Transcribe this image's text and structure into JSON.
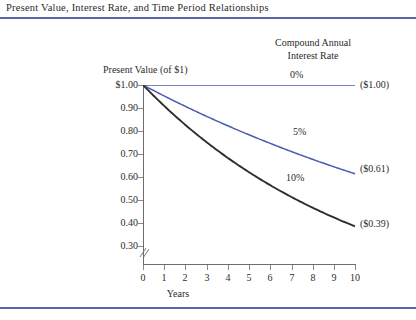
{
  "figure": {
    "title": "Present Value, Interest Rate, and Time Period Relationships",
    "rule_color": "#5b66a8"
  },
  "legend": {
    "header_line1": "Compound Annual",
    "header_line2": "Interest Rate"
  },
  "axes": {
    "y_title": "Present Value (of $1)",
    "x_title": "Years",
    "y_tick_labels": [
      "$1.00",
      "0.90",
      "0.80",
      "0.70",
      "0.60",
      "0.50",
      "0.40",
      "0.30"
    ],
    "x_tick_labels": [
      "0",
      "1",
      "2",
      "3",
      "4",
      "5",
      "6",
      "7",
      "8",
      "9",
      "10"
    ]
  },
  "curve_labels": {
    "rate0": "0%",
    "rate5": "5%",
    "rate10": "10%"
  },
  "end_labels": {
    "rate0": "($1.00)",
    "rate5": "($0.61)",
    "rate10": "($0.39)"
  },
  "chart_data": {
    "type": "line",
    "title": "Present Value, Interest Rate, and Time Period Relationships",
    "xlabel": "Years",
    "ylabel": "Present Value (of $1)",
    "xlim": [
      0,
      10
    ],
    "ylim": [
      0.25,
      1.0
    ],
    "ytick_values": [
      1.0,
      0.9,
      0.8,
      0.7,
      0.6,
      0.5,
      0.4,
      0.3
    ],
    "ytick_labels": [
      "$1.00",
      "0.90",
      "0.80",
      "0.70",
      "0.60",
      "0.50",
      "0.40",
      "0.30"
    ],
    "xtick_values": [
      0,
      1,
      2,
      3,
      4,
      5,
      6,
      7,
      8,
      9,
      10
    ],
    "y_axis_broken_below": 0.3,
    "grid": false,
    "legend_position": "inline-right",
    "legend_title": "Compound Annual Interest Rate",
    "x": [
      0,
      1,
      2,
      3,
      4,
      5,
      6,
      7,
      8,
      9,
      10
    ],
    "series": [
      {
        "name": "0%",
        "color": "#4a5bb5",
        "end_value_label": "($1.00)",
        "values": [
          1.0,
          1.0,
          1.0,
          1.0,
          1.0,
          1.0,
          1.0,
          1.0,
          1.0,
          1.0,
          1.0
        ]
      },
      {
        "name": "5%",
        "color": "#4a5bb5",
        "end_value_label": "($0.61)",
        "values": [
          1.0,
          0.95,
          0.91,
          0.86,
          0.82,
          0.78,
          0.75,
          0.71,
          0.68,
          0.64,
          0.61
        ]
      },
      {
        "name": "10%",
        "color": "#2e2e2e",
        "end_value_label": "($0.39)",
        "values": [
          1.0,
          0.91,
          0.83,
          0.75,
          0.68,
          0.62,
          0.56,
          0.51,
          0.47,
          0.42,
          0.39
        ]
      }
    ]
  }
}
